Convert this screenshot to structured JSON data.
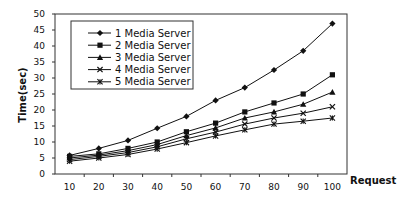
{
  "chart_data": {
    "type": "line",
    "title": "",
    "xlabel": "Request",
    "ylabel": "Time(sec)",
    "ylim": [
      0,
      50
    ],
    "yticks": [
      0,
      5,
      10,
      15,
      20,
      25,
      30,
      35,
      40,
      45,
      50
    ],
    "categories": [
      10,
      20,
      30,
      40,
      50,
      60,
      70,
      80,
      90,
      100
    ],
    "grid": false,
    "legend_position": "upper-left-inside",
    "series": [
      {
        "name": "1 Media Server",
        "marker": "diamond",
        "values": [
          5.8,
          8.0,
          10.5,
          14.3,
          18.0,
          23.0,
          27.0,
          32.5,
          38.5,
          47.0
        ]
      },
      {
        "name": "2 Media Server",
        "marker": "square",
        "values": [
          5.5,
          6.3,
          8.0,
          10.0,
          13.2,
          15.9,
          19.4,
          22.2,
          25.0,
          31.0
        ]
      },
      {
        "name": "3 Media Server",
        "marker": "triangle",
        "values": [
          5.0,
          5.9,
          7.3,
          9.2,
          12.0,
          14.4,
          17.5,
          19.4,
          21.8,
          25.6
        ]
      },
      {
        "name": "4 Media Server",
        "marker": "x",
        "values": [
          4.5,
          5.5,
          6.7,
          8.5,
          11.0,
          13.1,
          15.6,
          17.5,
          19.0,
          21.0
        ]
      },
      {
        "name": "5 Media Server",
        "marker": "star",
        "values": [
          4.0,
          5.0,
          6.1,
          7.8,
          9.8,
          11.9,
          13.8,
          15.6,
          16.5,
          17.5
        ]
      }
    ]
  },
  "colors": {
    "line": "#111111",
    "frame": "#333333",
    "background": "#ffffff"
  }
}
